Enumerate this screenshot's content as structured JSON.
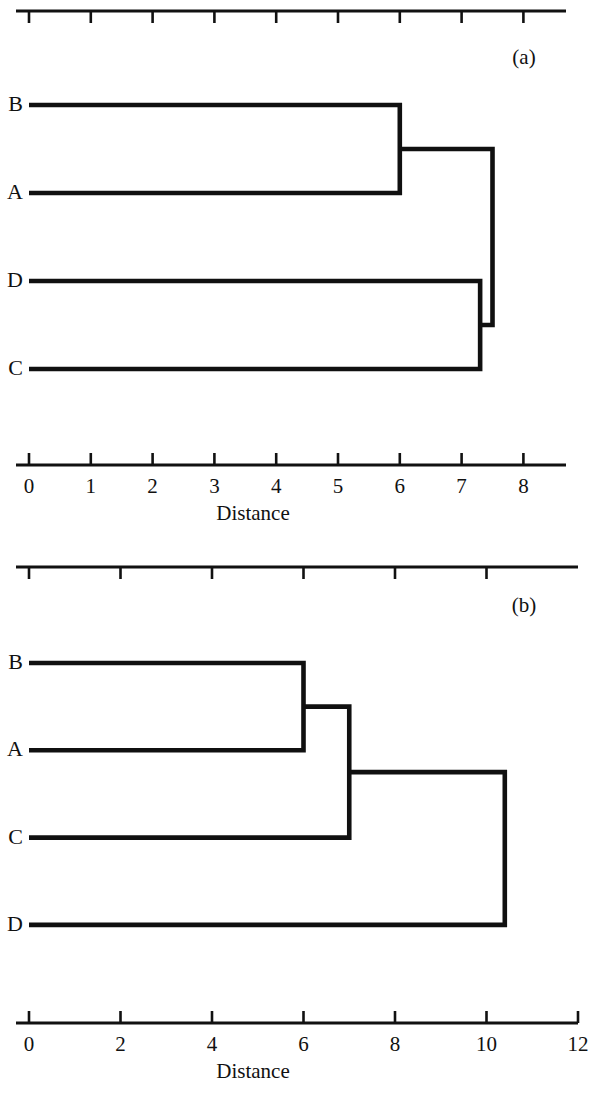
{
  "figure": {
    "background_color": "#ffffff",
    "line_color": "#101010",
    "axis_color": "#111111"
  },
  "chart_data": [
    {
      "type": "dendrogram",
      "panel_tag": "(a)",
      "title": "",
      "xlabel": "Distance",
      "ylabel": "",
      "xlim": [
        0,
        9
      ],
      "xticks": [
        0,
        1,
        2,
        3,
        4,
        5,
        6,
        7,
        8
      ],
      "xticklabels": [
        "0",
        "1",
        "2",
        "3",
        "4",
        "5",
        "6",
        "7",
        "8"
      ],
      "grid": false,
      "legend": "none",
      "orientation": "horizontal-left-to-right",
      "leaves": [
        "B",
        "A",
        "D",
        "C"
      ],
      "leaf_order_top_to_bottom": [
        "B",
        "A",
        "D",
        "C"
      ],
      "merges": [
        {
          "id": "m1",
          "members": [
            "B",
            "A"
          ],
          "height": 6.0
        },
        {
          "id": "m2",
          "members": [
            "D",
            "C"
          ],
          "height": 7.3
        },
        {
          "id": "m3",
          "members": [
            "m1",
            "m2"
          ],
          "height": 7.5
        }
      ],
      "axes_shown": [
        "top",
        "bottom"
      ],
      "top_axis_ticks": [
        0,
        1,
        2,
        3,
        4,
        5,
        6,
        7,
        8
      ],
      "top_axis_labels_shown": false
    },
    {
      "type": "dendrogram",
      "panel_tag": "(b)",
      "title": "",
      "xlabel": "Distance",
      "ylabel": "",
      "xlim": [
        0,
        12
      ],
      "xticks": [
        0,
        2,
        4,
        6,
        8,
        10,
        12
      ],
      "xticklabels": [
        "0",
        "2",
        "4",
        "6",
        "8",
        "10",
        "12"
      ],
      "grid": false,
      "legend": "none",
      "orientation": "horizontal-left-to-right",
      "leaves": [
        "B",
        "A",
        "C",
        "D"
      ],
      "leaf_order_top_to_bottom": [
        "B",
        "A",
        "C",
        "D"
      ],
      "merges": [
        {
          "id": "m1",
          "members": [
            "B",
            "A"
          ],
          "height": 6.0
        },
        {
          "id": "m2",
          "members": [
            "m1",
            "C"
          ],
          "height": 7.0
        },
        {
          "id": "m3",
          "members": [
            "m2",
            "D"
          ],
          "height": 10.4
        }
      ],
      "axes_shown": [
        "top",
        "bottom"
      ],
      "top_axis_ticks": [
        0,
        2,
        4,
        6,
        8,
        10
      ],
      "top_axis_labels_shown": false
    }
  ],
  "panel_a": {
    "tag": "(a)",
    "axis_title": "Distance",
    "leaf_labels": [
      "B",
      "A",
      "D",
      "C"
    ],
    "tick_labels": [
      "0",
      "1",
      "2",
      "3",
      "4",
      "5",
      "6",
      "7",
      "8"
    ]
  },
  "panel_b": {
    "tag": "(b)",
    "axis_title": "Distance",
    "leaf_labels": [
      "B",
      "A",
      "C",
      "D"
    ],
    "tick_labels": [
      "0",
      "2",
      "4",
      "6",
      "8",
      "10",
      "12"
    ]
  }
}
